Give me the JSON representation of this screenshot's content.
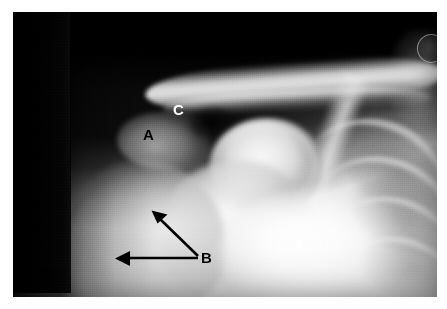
{
  "image": {
    "modality": "x-ray",
    "view": "shoulder-anteroposterior",
    "alt": "Anteroposterior shoulder radiograph with labelled structures A, B and C"
  },
  "plate": {
    "left": 13,
    "top": 12,
    "width": 424,
    "height": 285,
    "background_color": "#0a0a0a",
    "page_background_color": "#ffffff"
  },
  "annotations": {
    "labels": [
      {
        "id": "A",
        "text": "A",
        "color": "#000000",
        "x": 143,
        "y": 127,
        "target": "acromion"
      },
      {
        "id": "C",
        "text": "C",
        "color": "#ffffff",
        "x": 173,
        "y": 102,
        "target": "acromioclavicular-joint"
      },
      {
        "id": "B",
        "text": "B",
        "color": "#000000",
        "x": 201,
        "y": 250,
        "target": "scapular-region"
      }
    ],
    "arrows": [
      {
        "id": "arrow-b-upper",
        "color": "#000000",
        "from_x": 198,
        "from_y": 256,
        "to_x": 153,
        "to_y": 212,
        "head": "at-destination"
      },
      {
        "id": "arrow-b-lower",
        "color": "#000000",
        "from_x": 198,
        "from_y": 258,
        "to_x": 116,
        "to_y": 258,
        "head": "at-destination"
      }
    ]
  },
  "anatomy": {
    "structures": [
      "clavicle",
      "acromion",
      "acromioclavicular-joint",
      "humeral-head",
      "proximal-humerus",
      "scapula-body",
      "scapular-spine",
      "ribs",
      "lung-fields",
      "neck-soft-tissue"
    ],
    "collimation_edge_x": 70,
    "edge_artifact": {
      "x": 404,
      "y": 22,
      "diameter": 27
    }
  }
}
